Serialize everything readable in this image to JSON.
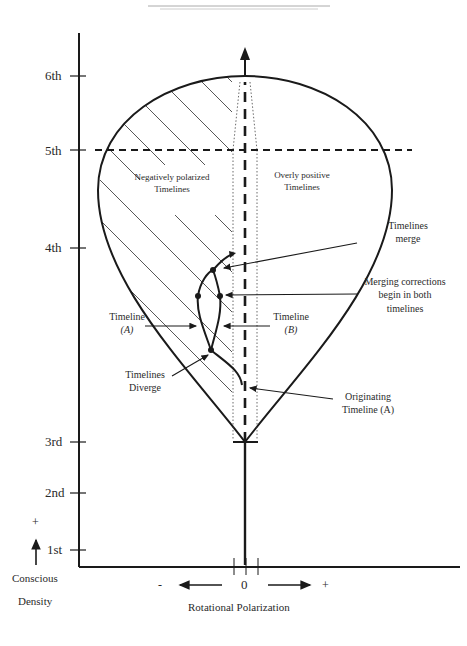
{
  "y_axis": {
    "ticks": [
      "1st",
      "2nd",
      "3rd",
      "4th",
      "5th",
      "6th"
    ],
    "plus_label": "+",
    "title_line1": "Conscious",
    "title_line2": "Density"
  },
  "x_axis": {
    "minus_label": "-",
    "zero_label": "0",
    "plus_label": "+",
    "title": "Rotational Polarization"
  },
  "regions": {
    "negative": {
      "line1": "Negatively polarized",
      "line2": "Timelines"
    },
    "positive": {
      "line1": "Overly positive",
      "line2": "Timelines"
    }
  },
  "annotations": {
    "merge": {
      "line1": "Timelines",
      "line2": "merge"
    },
    "merging_corrections": {
      "line1": "Merging corrections",
      "line2": "begin in both",
      "line3": "timelines"
    },
    "timeline_a": {
      "line1": "Timeline",
      "line2": "(A)"
    },
    "timeline_b": {
      "line1": "Timeline",
      "line2": "(B)"
    },
    "diverge": {
      "line1": "Timelines",
      "line2": "Diverge"
    },
    "originating": {
      "line1": "Originating",
      "line2": "Timeline (A)"
    }
  },
  "colors": {
    "ink": "#1a1a1a",
    "hatch": "#444444",
    "text": "#2a2a2a"
  }
}
